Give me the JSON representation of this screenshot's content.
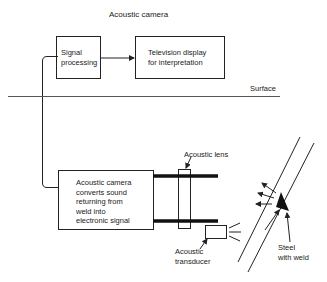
{
  "title": "Acoustic camera",
  "boxes": {
    "signal_processing": [
      "Signal",
      "processing"
    ],
    "tv_display": [
      "Television display",
      "for interpretation"
    ],
    "camera": [
      "Acoustic camera",
      "converts sound",
      "returning from",
      "weld into",
      "electronic signal"
    ]
  },
  "labels": {
    "surface": "Surface",
    "lens": "Acoustic lens",
    "transducer": [
      "Acoustic",
      "transducer"
    ],
    "steel": [
      "Steel",
      "with weld"
    ]
  }
}
